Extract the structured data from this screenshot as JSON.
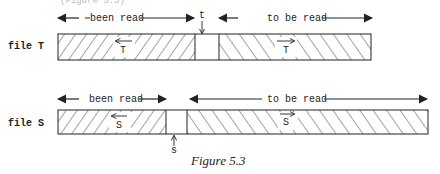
{
  "header_fragment": "(Figure 5.3)",
  "file_t": {
    "label": "file T",
    "left_label": "been read",
    "right_label": "to be read",
    "pointer_label": "t",
    "left_dir_label": "T",
    "right_dir_label": "T"
  },
  "file_s": {
    "label": "file S",
    "left_label": "been read",
    "right_label": "to be read",
    "pointer_label": "s",
    "left_dir_label": "S",
    "right_dir_label": "S"
  },
  "caption": "Figure 5.3",
  "colors": {
    "ink": "#222222",
    "background": "#ffffff"
  }
}
